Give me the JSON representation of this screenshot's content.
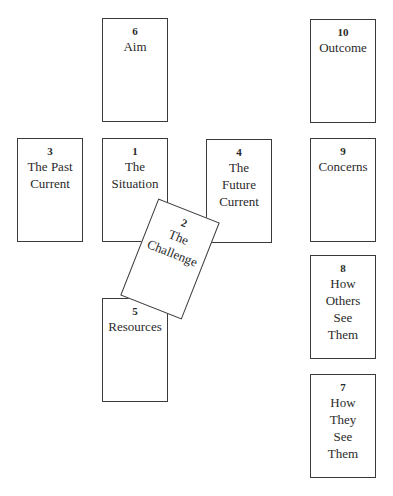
{
  "diagram": {
    "type": "tarot-spread-layout",
    "cards": [
      {
        "number": "1",
        "label": "The Situation"
      },
      {
        "number": "2",
        "label": "The Challenge"
      },
      {
        "number": "3",
        "label": "The Past Current"
      },
      {
        "number": "4",
        "label": "The Future Current"
      },
      {
        "number": "5",
        "label": "Resources"
      },
      {
        "number": "6",
        "label": "Aim"
      },
      {
        "number": "7",
        "label": "How They See Them"
      },
      {
        "number": "8",
        "label": "How Others See Them"
      },
      {
        "number": "9",
        "label": "Concerns"
      },
      {
        "number": "10",
        "label": "Outcome"
      }
    ],
    "lines": {
      "c1": [
        "The",
        "Situation"
      ],
      "c2": [
        "The",
        "Challenge"
      ],
      "c3": [
        "The Past",
        "Current"
      ],
      "c4": [
        "The",
        "Future",
        "Current"
      ],
      "c5": [
        "Resources"
      ],
      "c6": [
        "Aim"
      ],
      "c7": [
        "How",
        "They",
        "See",
        "Them"
      ],
      "c8": [
        "How",
        "Others",
        "See",
        "Them"
      ],
      "c9": [
        "Concerns"
      ],
      "c10": [
        "Outcome"
      ]
    }
  }
}
